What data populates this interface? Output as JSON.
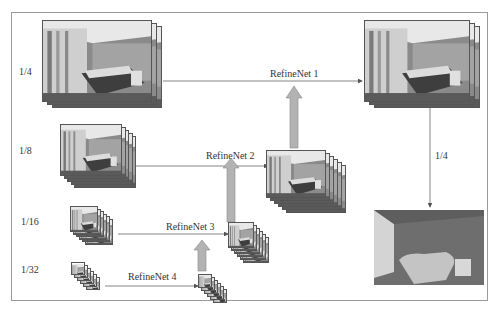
{
  "scales": {
    "quarter": "1/4",
    "eighth": "1/8",
    "sixteenth": "1/16",
    "thirtysecond": "1/32",
    "output": "1/4"
  },
  "blocks": {
    "refinenet1": "RefineNet 1",
    "refinenet2": "RefineNet 2",
    "refinenet3": "RefineNet 3",
    "refinenet4": "RefineNet 4"
  },
  "colors": {
    "line": "#555555",
    "up_arrow_fill": "#b3b3b3",
    "up_arrow_stroke": "#8a8a8a",
    "depth_bg": "#6e6e6e",
    "depth_wall": "#cfcfcf",
    "depth_bed": "#bdbdbd"
  }
}
